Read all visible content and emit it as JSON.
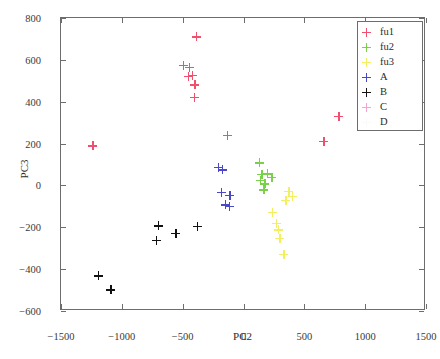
{
  "chart_data": {
    "type": "scatter",
    "title": "",
    "xlabel": "PC2",
    "ylabel": "PC3",
    "xlim": [
      -1500,
      1500
    ],
    "ylim": [
      -600,
      800
    ],
    "xticks": [
      -1500,
      -1000,
      -500,
      0,
      500,
      1000,
      1500
    ],
    "xticklabels": [
      "−1500",
      "−1000",
      "−500",
      "0",
      "500",
      "1000",
      "1500"
    ],
    "yticks": [
      -600,
      -400,
      -200,
      0,
      200,
      400,
      600,
      800
    ],
    "yticklabels": [
      "−600",
      "−400",
      "−200",
      "0",
      "200",
      "400",
      "600",
      "800"
    ],
    "grid": false,
    "marker": "plus",
    "legend_position": "upper-right",
    "series": [
      {
        "name": "fu1",
        "color": "#f0506e",
        "points": [
          [
            -1240,
            190
          ],
          [
            -390,
            710
          ],
          [
            -495,
            575
          ],
          [
            -445,
            565
          ],
          [
            -455,
            520
          ],
          [
            -420,
            525
          ],
          [
            -400,
            480
          ],
          [
            -405,
            420
          ],
          [
            -132,
            240
          ],
          [
            660,
            210
          ],
          [
            783,
            330
          ]
        ]
      },
      {
        "name": "fu2",
        "color": "#79d14a",
        "points": [
          [
            128,
            108
          ],
          [
            152,
            52
          ],
          [
            140,
            25
          ],
          [
            198,
            55
          ],
          [
            175,
            8
          ],
          [
            168,
            -20
          ],
          [
            232,
            38
          ]
        ]
      },
      {
        "name": "fu3",
        "color": "#f2f062",
        "points": [
          [
            372,
            -28
          ],
          [
            400,
            -52
          ],
          [
            348,
            -70
          ],
          [
            238,
            -128
          ],
          [
            268,
            -180
          ],
          [
            285,
            -212
          ],
          [
            298,
            -252
          ],
          [
            330,
            -330
          ]
        ]
      },
      {
        "name": "A",
        "color": "#4848c8",
        "points": [
          [
            -205,
            88
          ],
          [
            -172,
            75
          ],
          [
            -182,
            -32
          ],
          [
            -112,
            -48
          ],
          [
            -148,
            -92
          ],
          [
            -118,
            -100
          ]
        ]
      },
      {
        "name": "B",
        "color": "#111111",
        "points": [
          [
            -1195,
            -432
          ],
          [
            -1090,
            -498
          ],
          [
            -700,
            -192
          ],
          [
            -718,
            -262
          ],
          [
            -555,
            -228
          ],
          [
            -382,
            -196
          ]
        ]
      },
      {
        "name": "C",
        "color": "#f5a3d0",
        "points": []
      },
      {
        "name": "D",
        "color": "#fafafa",
        "points": []
      }
    ]
  },
  "legend": {
    "entries": [
      {
        "label": "fu1",
        "color": "#f0506e"
      },
      {
        "label": "fu2",
        "color": "#79d14a"
      },
      {
        "label": "fu3",
        "color": "#f2f062"
      },
      {
        "label": "A",
        "color": "#4848c8"
      },
      {
        "label": "B",
        "color": "#111111"
      },
      {
        "label": "C",
        "color": "#f5a3d0"
      },
      {
        "label": "D",
        "color": "#fafafa"
      }
    ]
  }
}
